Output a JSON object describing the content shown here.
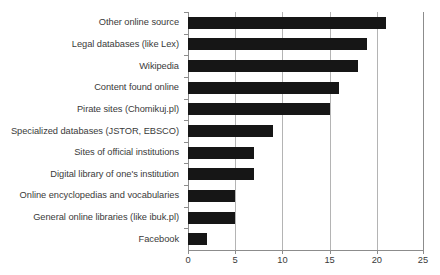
{
  "chart_data": {
    "type": "bar",
    "orientation": "horizontal",
    "title": "",
    "xlabel": "",
    "ylabel": "",
    "xlim": [
      0,
      25
    ],
    "xticks": [
      0,
      5,
      10,
      15,
      20,
      25
    ],
    "grid": true,
    "legend": false,
    "bar_color": "#161616",
    "categories": [
      "Other online source",
      "Legal databases (like Lex)",
      "Wikipedia",
      "Content found online",
      "Pirate sites (Chomikuj.pl)",
      "Specialized databases (JSTOR, EBSCO)",
      "Sites of official institutions",
      "Digital library of one's institution",
      "Online encyclopedias and vocabularies",
      "General online libraries (like ibuk.pl)",
      "Facebook"
    ],
    "values": [
      21,
      19,
      18,
      16,
      15,
      9,
      7,
      7,
      5,
      5,
      2
    ]
  }
}
